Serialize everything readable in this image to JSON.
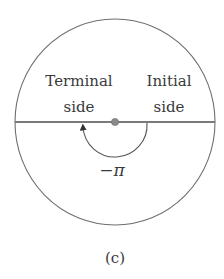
{
  "figure": {
    "caption": "(c)",
    "labels": {
      "terminal_line1": "Terminal",
      "terminal_line2": "side",
      "initial_line1": "Initial",
      "initial_line2": "side",
      "angle": "−π"
    },
    "geometry": {
      "circle_center": [
        115,
        122
      ],
      "circle_radius": 100,
      "arc_radius": 32,
      "angle_radians": "-pi",
      "arc_direction": "clockwise"
    },
    "colors": {
      "circle_stroke": "#6e6e6e",
      "axis_line": "#7a7a7a",
      "center_dot": "#8a8a8a",
      "text": "#3a3a3a"
    }
  }
}
